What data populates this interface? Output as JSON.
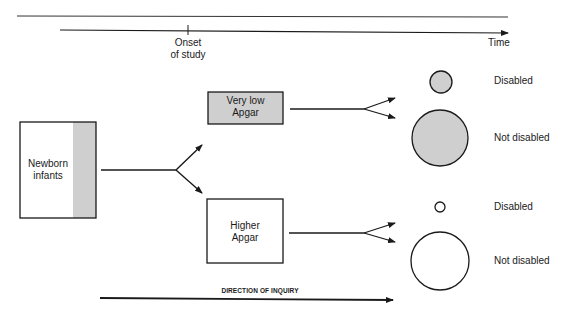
{
  "timeline": {
    "onset_label_line1": "Onset",
    "onset_label_line2": "of study",
    "time_label": "Time"
  },
  "boxes": {
    "newborn": {
      "line1": "Newborn",
      "line2": "infants"
    },
    "very_low": {
      "line1": "Very low",
      "line2": "Apgar"
    },
    "higher": {
      "line1": "Higher",
      "line2": "Apgar"
    }
  },
  "outcomes": {
    "very_low_disabled": "Disabled",
    "very_low_not_disabled": "Not disabled",
    "higher_disabled": "Disabled",
    "higher_not_disabled": "Not disabled"
  },
  "direction": {
    "label": "DIRECTION OF INQUIRY"
  },
  "colors": {
    "shade": "#cfcfcf",
    "line": "#1a1a1a"
  }
}
